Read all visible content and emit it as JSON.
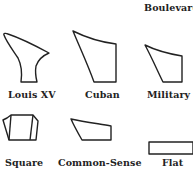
{
  "figure": {
    "heels": [
      {
        "label": "Boulevard"
      },
      {
        "label": "Louis XV"
      },
      {
        "label": "Cuban"
      },
      {
        "label": "Military"
      },
      {
        "label": "Square"
      },
      {
        "label": "Common-Sense"
      },
      {
        "label": "Flat"
      }
    ]
  }
}
